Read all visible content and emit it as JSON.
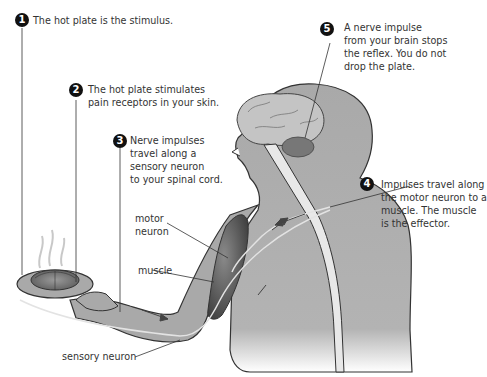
{
  "steps": [
    {
      "number": "1",
      "lines": [
        "The hot plate is the stimulus."
      ]
    },
    {
      "number": "2",
      "lines": [
        "The hot plate stimulates",
        "pain receptors in your skin."
      ]
    },
    {
      "number": "3",
      "lines": [
        "Nerve impulses",
        "travel along a",
        "sensory neuron",
        "to your spinal cord."
      ]
    },
    {
      "number": "4",
      "lines": [
        "Impulses  travel along",
        "the motor neuron to a",
        "muscle. The muscle",
        "is the effector."
      ]
    },
    {
      "number": "5",
      "lines": [
        "A nerve impulse",
        "from your brain stops",
        "the reflex. You do not",
        "drop the plate."
      ]
    }
  ],
  "labels": {
    "motor_neuron": [
      "motor",
      "neuron"
    ],
    "muscle": "muscle",
    "sensory_neuron": "sensory neuron"
  },
  "colors": {
    "body": "#a9a9a9",
    "body_outline": "#333333",
    "brain": "#bdbdbd",
    "cerebellum": "#7a7a7a",
    "spinal_cord": "#e6e6e6",
    "muscle": "#5c5c5c",
    "badge": "#111111"
  }
}
